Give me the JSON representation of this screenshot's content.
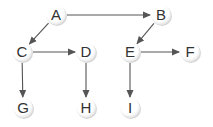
{
  "diagram": {
    "type": "directed-tree",
    "colors": {
      "edge": "#555555",
      "node_fill": "#ffffff",
      "node_shadow": "#d6d6d6",
      "label": "#333333"
    },
    "nodes": [
      {
        "id": "A",
        "label": "A",
        "x": 56,
        "y": 15
      },
      {
        "id": "B",
        "label": "B",
        "x": 161,
        "y": 15
      },
      {
        "id": "C",
        "label": "C",
        "x": 22,
        "y": 52
      },
      {
        "id": "D",
        "label": "D",
        "x": 86,
        "y": 52
      },
      {
        "id": "E",
        "label": "E",
        "x": 130,
        "y": 52
      },
      {
        "id": "F",
        "label": "F",
        "x": 190,
        "y": 52
      },
      {
        "id": "G",
        "label": "G",
        "x": 23,
        "y": 108
      },
      {
        "id": "H",
        "label": "H",
        "x": 86,
        "y": 108
      },
      {
        "id": "I",
        "label": "I",
        "x": 130,
        "y": 108
      }
    ],
    "edges": [
      {
        "from": "A",
        "to": "B"
      },
      {
        "from": "A",
        "to": "C"
      },
      {
        "from": "B",
        "to": "E"
      },
      {
        "from": "C",
        "to": "D"
      },
      {
        "from": "C",
        "to": "G"
      },
      {
        "from": "D",
        "to": "H"
      },
      {
        "from": "E",
        "to": "F"
      },
      {
        "from": "E",
        "to": "I"
      }
    ]
  }
}
